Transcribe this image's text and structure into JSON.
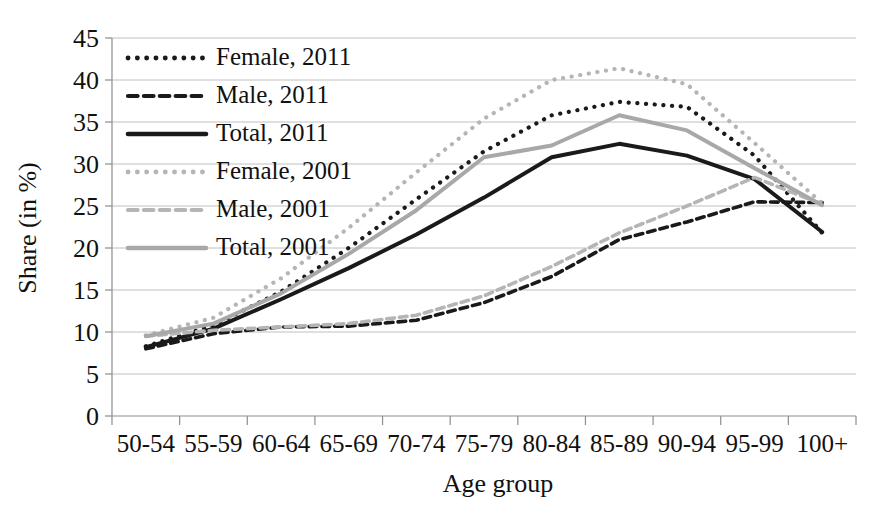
{
  "chart_data": {
    "type": "line",
    "title": "",
    "xlabel": "Age group",
    "ylabel": "Share (in %)",
    "categories": [
      "50-54",
      "55-59",
      "60-64",
      "65-69",
      "70-74",
      "75-79",
      "80-84",
      "85-89",
      "90-94",
      "95-99",
      "100+"
    ],
    "ylim": [
      0,
      45
    ],
    "ytick_labels": [
      "0",
      "5",
      "10",
      "15",
      "20",
      "25",
      "30",
      "35",
      "40",
      "45"
    ],
    "ytick_values": [
      0,
      5,
      10,
      15,
      20,
      25,
      30,
      35,
      40,
      45
    ],
    "grid": "horizontal",
    "legend_position": "top-left",
    "series": [
      {
        "name": "Female, 2011",
        "style": "dotted",
        "color": "#1a1a1a",
        "values": [
          8.3,
          10.8,
          14.8,
          20.0,
          25.8,
          31.5,
          35.8,
          37.4,
          36.8,
          31.0,
          21.8
        ]
      },
      {
        "name": "Male, 2011",
        "style": "dashed",
        "color": "#1a1a1a",
        "values": [
          8.0,
          9.8,
          10.6,
          10.7,
          11.4,
          13.5,
          16.6,
          21.0,
          23.1,
          25.5,
          25.4
        ]
      },
      {
        "name": "Total, 2011",
        "style": "solid",
        "color": "#1a1a1a",
        "values": [
          8.2,
          10.4,
          13.9,
          17.6,
          21.6,
          26.0,
          30.8,
          32.4,
          31.0,
          28.2,
          21.9
        ]
      },
      {
        "name": "Female, 2001",
        "style": "dotted",
        "color": "#b5b5b5",
        "values": [
          9.6,
          11.7,
          16.4,
          22.4,
          29.0,
          35.4,
          40.0,
          41.4,
          39.5,
          32.5,
          25.3
        ]
      },
      {
        "name": "Male, 2001",
        "style": "dashed",
        "color": "#b5b5b5",
        "values": [
          9.5,
          10.2,
          10.6,
          11.0,
          12.0,
          14.3,
          17.8,
          21.8,
          25.0,
          28.4,
          25.2
        ]
      },
      {
        "name": "Total, 2001",
        "style": "solid",
        "color": "#a8a8a8",
        "values": [
          9.5,
          11.0,
          14.6,
          19.3,
          24.5,
          30.8,
          32.2,
          35.8,
          34.0,
          29.5,
          25.1
        ]
      }
    ]
  },
  "legend": {
    "entries": [
      {
        "label": "Female, 2011"
      },
      {
        "label": "Male, 2011"
      },
      {
        "label": "Total, 2011"
      },
      {
        "label": "Female, 2001"
      },
      {
        "label": "Male, 2001"
      },
      {
        "label": "Total, 2001"
      }
    ]
  }
}
